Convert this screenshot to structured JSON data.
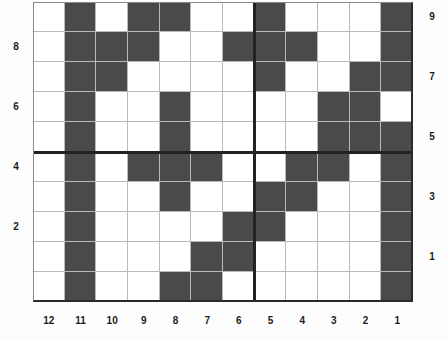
{
  "chart_data": {
    "type": "heatmap",
    "title": "",
    "xlabel": "",
    "ylabel": "",
    "n_cols": 12,
    "n_rows": 10,
    "filled_color": "#4a4a4a",
    "empty_color": "#ffffff",
    "grid": true,
    "grid_color": "#b9b9b9",
    "x_axis": {
      "position": "bottom",
      "direction": "descending",
      "tick_labels": [
        "12",
        "11",
        "10",
        "9",
        "8",
        "7",
        "6",
        "5",
        "4",
        "3",
        "2",
        "1"
      ]
    },
    "y_axis_left": {
      "position": "left",
      "tick_labels": [
        "8",
        "6",
        "4",
        "2"
      ],
      "tick_rows": [
        2,
        4,
        6,
        8
      ]
    },
    "y_axis_right": {
      "position": "right",
      "tick_labels": [
        "9",
        "7",
        "5",
        "3",
        "1"
      ],
      "tick_rows": [
        1,
        3,
        5,
        7,
        9
      ]
    },
    "separators": {
      "horizontal_after_row": 5,
      "vertical_after_col": 7,
      "color": "#222222"
    },
    "rows": [
      {
        "row_label": "",
        "values": [
          0,
          1,
          0,
          1,
          1,
          0,
          0,
          1,
          0,
          0,
          0,
          1
        ]
      },
      {
        "row_label": "",
        "values": [
          0,
          1,
          1,
          1,
          0,
          0,
          1,
          1,
          1,
          0,
          0,
          1
        ]
      },
      {
        "row_label": "",
        "values": [
          0,
          1,
          1,
          0,
          0,
          0,
          0,
          1,
          0,
          0,
          1,
          1
        ]
      },
      {
        "row_label": "",
        "values": [
          0,
          1,
          0,
          0,
          1,
          0,
          0,
          0,
          0,
          1,
          1,
          0
        ]
      },
      {
        "row_label": "",
        "values": [
          0,
          1,
          0,
          0,
          1,
          0,
          0,
          0,
          0,
          1,
          1,
          1
        ]
      },
      {
        "row_label": "",
        "values": [
          0,
          1,
          0,
          1,
          1,
          1,
          0,
          0,
          1,
          1,
          0,
          1
        ]
      },
      {
        "row_label": "",
        "values": [
          0,
          1,
          0,
          0,
          1,
          0,
          0,
          1,
          1,
          0,
          0,
          1
        ]
      },
      {
        "row_label": "",
        "values": [
          0,
          1,
          0,
          0,
          0,
          0,
          1,
          1,
          0,
          0,
          0,
          1
        ]
      },
      {
        "row_label": "",
        "values": [
          0,
          1,
          0,
          0,
          0,
          1,
          1,
          0,
          0,
          0,
          0,
          1
        ]
      },
      {
        "row_label": "",
        "values": [
          0,
          1,
          0,
          0,
          1,
          1,
          0,
          0,
          0,
          0,
          0,
          1
        ]
      }
    ]
  },
  "axes": {
    "left_labels": [
      {
        "text": "8",
        "row": 2
      },
      {
        "text": "6",
        "row": 4
      },
      {
        "text": "4",
        "row": 6
      },
      {
        "text": "2",
        "row": 8
      }
    ],
    "right_labels": [
      {
        "text": "9",
        "row": 1
      },
      {
        "text": "7",
        "row": 3
      },
      {
        "text": "5",
        "row": 5
      },
      {
        "text": "3",
        "row": 7
      },
      {
        "text": "1",
        "row": 9
      }
    ],
    "bottom_labels": [
      {
        "text": "12",
        "col": 1
      },
      {
        "text": "11",
        "col": 2
      },
      {
        "text": "10",
        "col": 3
      },
      {
        "text": "9",
        "col": 4
      },
      {
        "text": "8",
        "col": 5
      },
      {
        "text": "7",
        "col": 6
      },
      {
        "text": "6",
        "col": 7
      },
      {
        "text": "5",
        "col": 8
      },
      {
        "text": "4",
        "col": 9
      },
      {
        "text": "3",
        "col": 10
      },
      {
        "text": "2",
        "col": 11
      },
      {
        "text": "1",
        "col": 12
      }
    ]
  }
}
